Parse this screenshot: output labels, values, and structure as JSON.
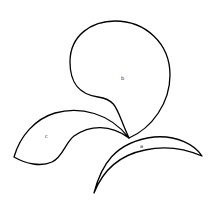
{
  "diagram": {
    "type": "line-drawing",
    "stroke_color": "#000000",
    "background": "#ffffff",
    "shapes": [
      {
        "id": "a",
        "label": "a",
        "kind": "crescent"
      },
      {
        "id": "b",
        "label": "b",
        "kind": "teardrop"
      },
      {
        "id": "c",
        "label": "c",
        "kind": "leaf"
      }
    ]
  }
}
